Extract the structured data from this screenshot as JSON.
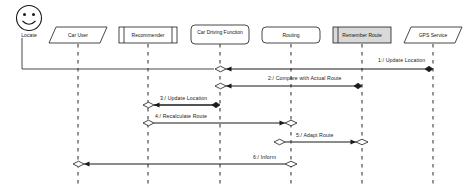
{
  "diagram": {
    "actor": {
      "name": "Locate",
      "icon": "smiley-face-icon"
    },
    "lifelines": [
      {
        "id": "car-user",
        "label": "Car User",
        "shape": "parallelogram",
        "cx": 78,
        "width": 58,
        "fill": "#ffffff"
      },
      {
        "id": "recommender",
        "label": "Recommender",
        "shape": "barred-rect",
        "cx": 148,
        "width": 58,
        "fill": "#ffffff"
      },
      {
        "id": "car-driving",
        "label": "Car Driving Function",
        "shape": "rounded-rect",
        "cx": 220,
        "width": 58,
        "fill": "#ffffff"
      },
      {
        "id": "routing",
        "label": "Routing",
        "shape": "rounded-rect",
        "cx": 291,
        "width": 58,
        "fill": "#ffffff"
      },
      {
        "id": "remember-route",
        "label": "Remember Route",
        "shape": "barred-rect",
        "cx": 362,
        "width": 58,
        "fill": "#d9d9d9"
      },
      {
        "id": "gps-service",
        "label": "GPS Service",
        "shape": "parallelogram",
        "cx": 433,
        "width": 58,
        "fill": "#ffffff"
      }
    ],
    "messages": [
      {
        "num": "1",
        "label": "1:/ Update Location",
        "from": "gps-service",
        "to": "car-driving",
        "y": 69,
        "dir": "left",
        "source_marker": "filled-diamond",
        "target_marker": "hollow-diamond"
      },
      {
        "num": "2",
        "label": "2:/ Compare with Actual Route",
        "from": "remember-route",
        "to": "car-driving",
        "y": 86,
        "dir": "left",
        "source_marker": "filled-diamond",
        "target_marker": "hollow-diamond"
      },
      {
        "num": "3",
        "label": "3:/ Update Location",
        "from": "car-driving",
        "to": "recommender",
        "y": 105,
        "dir": "left",
        "source_marker": "filled-diamond",
        "target_marker": "hollow-diamond"
      },
      {
        "num": "4",
        "label": "4:/ Recalculate Route",
        "from": "recommender",
        "to": "routing",
        "y": 123,
        "dir": "right",
        "source_marker": "hollow-diamond",
        "target_marker": "hollow-diamond"
      },
      {
        "num": "5",
        "label": "5:/ Adapt Route",
        "from": "routing",
        "to": "remember-route",
        "y": 142,
        "dir": "right",
        "source_marker": "hollow-diamond",
        "target_marker": "hollow-diamond"
      },
      {
        "num": "6",
        "label": "6:/ Inform",
        "from": "routing",
        "to": "car-user",
        "y": 164,
        "dir": "left",
        "source_marker": "hollow-diamond",
        "target_marker": "hollow-diamond"
      }
    ],
    "colors": {
      "line": "#1a1a1a",
      "lifeline_dash": "#4a4a4a",
      "background": "#ffffff",
      "shaded_box": "#d9d9d9"
    }
  }
}
